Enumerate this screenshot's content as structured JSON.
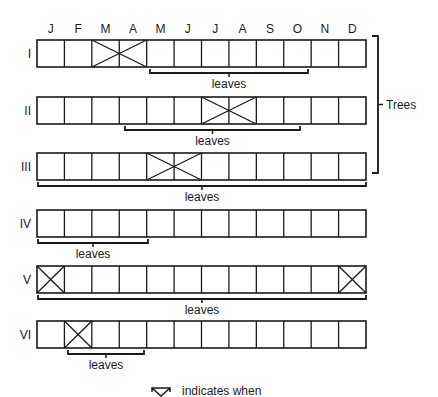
{
  "months": [
    "J",
    "F",
    "M",
    "A",
    "M",
    "J",
    "J",
    "A",
    "S",
    "O",
    "N",
    "D"
  ],
  "grid": {
    "left": 37,
    "right": 366,
    "cell_height": 27
  },
  "rows": [
    {
      "label": "I",
      "top": 40,
      "flower_span": [
        2,
        3
      ],
      "leaves_px": [
        150,
        308
      ],
      "leaves_label": "leaves"
    },
    {
      "label": "II",
      "top": 97,
      "flower_span": [
        6,
        7
      ],
      "leaves_px": [
        125,
        300
      ],
      "leaves_label": "leaves"
    },
    {
      "label": "III",
      "top": 153,
      "flower_span": [
        4,
        5
      ],
      "leaves_px": [
        38,
        366
      ],
      "leaves_label": "leaves"
    },
    {
      "label": "IV",
      "top": 210,
      "flower_span": null,
      "leaves_px": [
        38,
        148
      ],
      "leaves_label": "leaves"
    },
    {
      "label": "V",
      "top": 266,
      "flower_spans": [
        [
          0,
          0
        ],
        [
          11,
          11
        ]
      ],
      "leaves_px": [
        38,
        366
      ],
      "leaves_label": "leaves"
    },
    {
      "label": "VI",
      "top": 321,
      "flower_span": [
        1,
        1
      ],
      "leaves_px": [
        68,
        144
      ],
      "leaves_label": "leaves"
    }
  ],
  "group_bracket": {
    "label": "Trees",
    "x": 378,
    "top": 36,
    "bottom": 173
  },
  "legend": {
    "text": "indicates when"
  },
  "colors": {
    "line": "#1a1a1a",
    "background": "#ffffff"
  }
}
